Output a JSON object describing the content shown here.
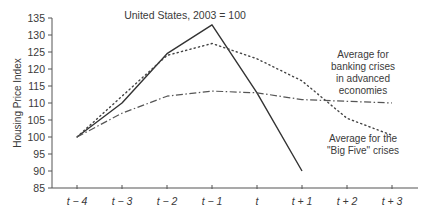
{
  "chart_data": {
    "type": "line",
    "title": "",
    "xlabel": "",
    "ylabel": "Housing Price Index",
    "ylim": [
      85,
      135
    ],
    "yticks": [
      85,
      90,
      95,
      100,
      105,
      110,
      115,
      120,
      125,
      130,
      135
    ],
    "categories": [
      "t − 4",
      "t − 3",
      "t − 2",
      "t − 1",
      "t",
      "t + 1",
      "t + 2",
      "t + 3"
    ],
    "grid": false,
    "legend_position": "inline annotations",
    "series": [
      {
        "name": "United States, 2003 = 100",
        "style": "solid",
        "values": [
          100,
          110,
          124.5,
          133,
          113,
          90,
          null,
          null
        ]
      },
      {
        "name": "Average for the \"Big Five\" crises",
        "style": "dotted",
        "values": [
          100,
          112,
          124,
          127.5,
          123,
          116.5,
          105.5,
          100.5
        ]
      },
      {
        "name": "Average for banking crises in advanced economies",
        "style": "dash-dot",
        "values": [
          100,
          107,
          112,
          113.5,
          113,
          111,
          110.5,
          110
        ]
      }
    ],
    "annotations": [
      {
        "text": "United States, 2003 = 100",
        "near": "top center"
      },
      {
        "text": "Average for banking crises in advanced economies",
        "near": "right, upper"
      },
      {
        "text": "Average for the \"Big Five\" crises",
        "near": "right, lower"
      }
    ]
  },
  "labels": {
    "ylabel": "Housing Price Index",
    "us_annotation": "United States, 2003 = 100",
    "advanced_line1": "Average for",
    "advanced_line2": "banking crises",
    "advanced_line3": "in advanced",
    "advanced_line4": "economies",
    "bigfive_line1": "Average for the",
    "bigfive_line2": "\"Big Five\" crises"
  }
}
